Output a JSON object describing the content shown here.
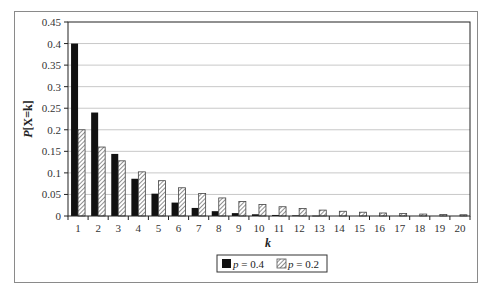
{
  "chart_data": {
    "type": "bar",
    "title": "",
    "xlabel": "k",
    "ylabel": "P[X=k]",
    "ylim": [
      0,
      0.45
    ],
    "yticks": [
      "0",
      "0.05",
      "0.1",
      "0.15",
      "0.2",
      "0.25",
      "0.3",
      "0.35",
      "0.4",
      "0.45"
    ],
    "grid": true,
    "legend_position": "bottom",
    "categories": [
      "1",
      "2",
      "3",
      "4",
      "5",
      "6",
      "7",
      "8",
      "9",
      "10",
      "11",
      "12",
      "13",
      "14",
      "15",
      "16",
      "17",
      "18",
      "19",
      "20"
    ],
    "series": [
      {
        "name": "p = 0.4",
        "style": "solid-black",
        "color": "#111111",
        "values": [
          0.4,
          0.24,
          0.144,
          0.0864,
          0.0518,
          0.0311,
          0.0187,
          0.0112,
          0.0067,
          0.004,
          0.0024,
          0.0015,
          0.0009,
          0.0005,
          0.0003,
          0.0002,
          0.0001,
          0.0001,
          0.0,
          0.0
        ]
      },
      {
        "name": "p = 0.2",
        "style": "diagonal-hatch",
        "color": "#777777",
        "values": [
          0.2,
          0.16,
          0.128,
          0.1024,
          0.0819,
          0.0655,
          0.0524,
          0.0419,
          0.0336,
          0.0268,
          0.0215,
          0.0172,
          0.0137,
          0.011,
          0.0088,
          0.007,
          0.0056,
          0.0045,
          0.0036,
          0.0029
        ]
      }
    ]
  },
  "legend": {
    "items": [
      {
        "label_var": "p",
        "label_rest": " = 0.4"
      },
      {
        "label_var": "p",
        "label_rest": " = 0.2"
      }
    ]
  },
  "axes": {
    "x_title": "k",
    "y_title_var": "P",
    "y_title_rest": "[X=k]"
  }
}
